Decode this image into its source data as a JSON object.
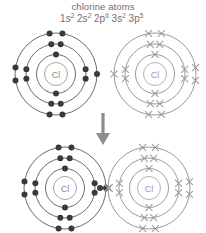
{
  "title": "chlorine atoms",
  "electron_configuration": {
    "full_text": "1s2 2s2 2p6 3s2 3p5",
    "terms": [
      {
        "shell": "1s",
        "count": "2"
      },
      {
        "shell": "2s",
        "count": "2"
      },
      {
        "shell": "2p",
        "count": "6"
      },
      {
        "shell": "3s",
        "count": "2"
      },
      {
        "shell": "3p",
        "count": "5"
      }
    ]
  },
  "colors": {
    "background": "#ffffff",
    "text": "#6f6f6f",
    "ring_dark": "#5a5a5a",
    "ring_light": "#8e8e8e",
    "electron_dot": "#3a3a3a",
    "electron_cross": "#9d9d9d",
    "nucleus_label": "#8a8a8a",
    "arrow": "#8c8c8c"
  },
  "chart_data": {
    "type": "diagram",
    "title": "chlorine atoms",
    "subtitle": "1s2 2s2 2p6 3s2 3p5",
    "shell_occupancy": [
      2,
      8,
      7
    ],
    "shell_labels": [
      "K",
      "L",
      "M"
    ],
    "atoms": [
      {
        "id": "top-left-atom",
        "symbol": "Cl",
        "electron_style": "dot",
        "shells": [
          2,
          8,
          7
        ],
        "state": "separate"
      },
      {
        "id": "top-right-atom",
        "symbol": "Cl",
        "electron_style": "cross",
        "shells": [
          2,
          8,
          7
        ],
        "state": "separate"
      },
      {
        "id": "bottom-left-atom",
        "symbol": "Cl",
        "electron_style": "dot",
        "shells": [
          2,
          8,
          7
        ],
        "state": "bonded"
      },
      {
        "id": "bottom-right-atom",
        "symbol": "Cl",
        "electron_style": "cross",
        "shells": [
          2,
          8,
          7
        ],
        "state": "bonded"
      }
    ],
    "bond": {
      "type": "single covalent",
      "shared_electrons": 2,
      "shared_pair": "one dot and one cross"
    },
    "arrow": {
      "direction": "down",
      "meaning": "atoms react to form molecule"
    }
  },
  "atoms": {
    "symbol": "Cl",
    "top_left": {
      "symbol": "Cl",
      "style": "dot"
    },
    "top_right": {
      "symbol": "Cl",
      "style": "cross"
    },
    "bottom_left": {
      "symbol": "Cl",
      "style": "dot"
    },
    "bottom_right": {
      "symbol": "Cl",
      "style": "cross"
    }
  }
}
